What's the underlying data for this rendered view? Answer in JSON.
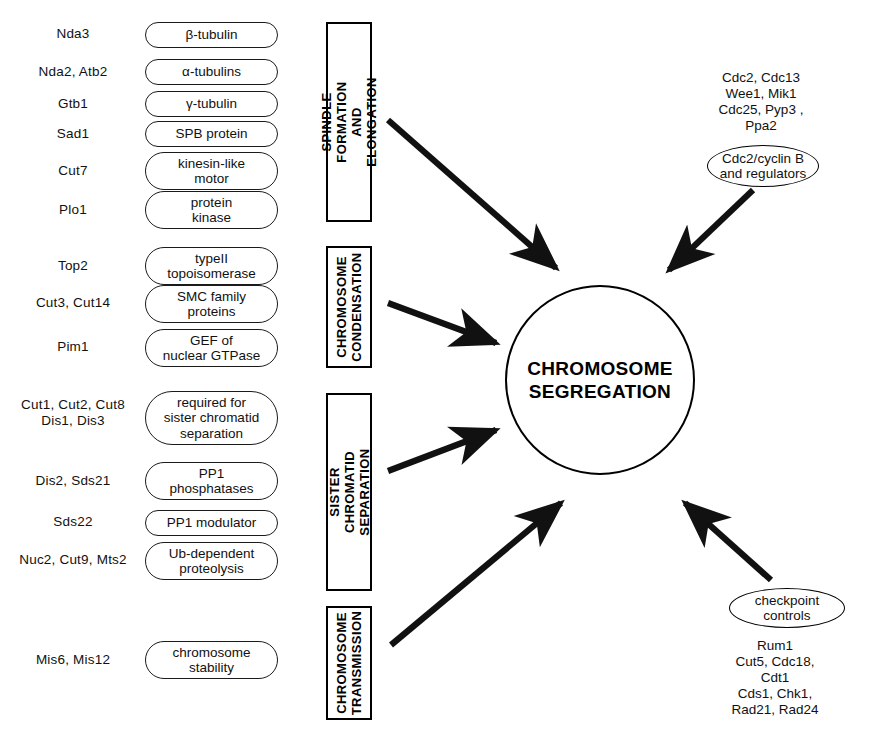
{
  "diagram": {
    "center": {
      "label": "CHROMOSOME\nSEGREGATION"
    },
    "gene_groups": [
      {
        "name": "spindle-formation",
        "rows": [
          {
            "genes": "Nda3",
            "function": "β-tubulin"
          },
          {
            "genes": "Nda2, Atb2",
            "function": "α-tubulins"
          },
          {
            "genes": "Gtb1",
            "function": "γ-tubulin"
          },
          {
            "genes": "Sad1",
            "function": "SPB protein"
          },
          {
            "genes": "Cut7",
            "function": "kinesin-like\nmotor"
          },
          {
            "genes": "Plo1",
            "function": "protein\nkinase"
          }
        ]
      },
      {
        "name": "chromosome-condensation",
        "rows": [
          {
            "genes": "Top2",
            "function": "typeII\ntopoisomerase"
          },
          {
            "genes": "Cut3, Cut14",
            "function": "SMC family\nproteins"
          },
          {
            "genes": "Pim1",
            "function": "GEF of\nnuclear GTPase"
          }
        ]
      },
      {
        "name": "sister-chromatid-separation",
        "rows": [
          {
            "genes": "Cut1, Cut2, Cut8\nDis1, Dis3",
            "function": "required for\nsister chromatid\nseparation"
          },
          {
            "genes": "Dis2, Sds21",
            "function": "PP1\nphosphatases"
          },
          {
            "genes": "Sds22",
            "function": "PP1 modulator"
          },
          {
            "genes": "Nuc2, Cut9, Mts2",
            "function": "Ub-dependent\nproteolysis"
          }
        ]
      },
      {
        "name": "chromosome-transmission",
        "rows": [
          {
            "genes": "Mis6, Mis12",
            "function": "chromosome\nstability"
          }
        ]
      }
    ],
    "processes": [
      {
        "name": "spindle-formation-and-elongation",
        "label": "SPINDLE FORMATION\nAND ELONGATION"
      },
      {
        "name": "chromosome-condensation",
        "label": "CHROMOSOME\nCONDENSATION"
      },
      {
        "name": "sister-chromatid-separation",
        "label": "SISTER CHROMATID\nSEPARATION"
      },
      {
        "name": "chromosome-transmission",
        "label": "CHROMOSOME\nTRANSMISSION"
      }
    ],
    "regulators": [
      {
        "name": "cdc2-cyclin-b",
        "gene_list": "Cdc2, Cdc13\nWee1, Mik1\nCdc25, Pyp3 , Ppa2",
        "label": "Cdc2/cyclin B\nand regulators"
      },
      {
        "name": "checkpoint-controls",
        "label": "checkpoint\ncontrols",
        "gene_list": "Rum1\nCut5, Cdc18, Cdt1\nCds1, Chk1, Rad21, Rad24"
      }
    ],
    "colors": {
      "line": "#000000",
      "fill": "#ffffff",
      "text": "#111111"
    }
  }
}
